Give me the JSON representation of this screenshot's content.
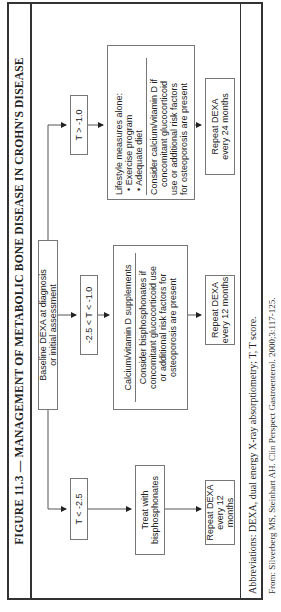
{
  "figure": {
    "title": "FIGURE 11.3 — MANAGEMENT OF METABOLIC BONE DISEASE IN CROHN'S DISEASE",
    "nodes": {
      "baseline": [
        "Baseline DEXA at diagnosis",
        "or initial assessment"
      ],
      "t_low": "T < -2.5",
      "t_mid": "-2.5 < T < -1.0",
      "t_high": "T > -1.0",
      "treat": [
        "Treat with",
        "bisphosphonates"
      ],
      "calcium": {
        "heading": "Calcium/vitamin D supplements",
        "body": [
          "Consider bisphosphonates if",
          "concomitant glucocorticoid use",
          "or additional risk factors for",
          "osteoporosis are present"
        ]
      },
      "lifestyle": {
        "heading": "Lifestyle measures alone:",
        "bullets": [
          "• Exercise program",
          "• Adequate diet"
        ],
        "body": [
          "Consider calcium/vitamin D if",
          "concomitant glucocorticoid",
          "use or additional risk factors",
          "for osteoporosis are present"
        ]
      },
      "repeat_low": [
        "Repeat DEXA",
        "every 12 months"
      ],
      "repeat_mid": [
        "Repeat DEXA",
        "every 12 months"
      ],
      "repeat_high": [
        "Repeat DEXA",
        "every 24 months"
      ]
    },
    "abbreviations": "Abbreviations: DEXA, dual energy X-ray absorptiometry; T, T score.",
    "source": "From: Silverberg MS, Steinhart AH. Clin Perspect Gastroenterol. 2000;3:117-125."
  }
}
